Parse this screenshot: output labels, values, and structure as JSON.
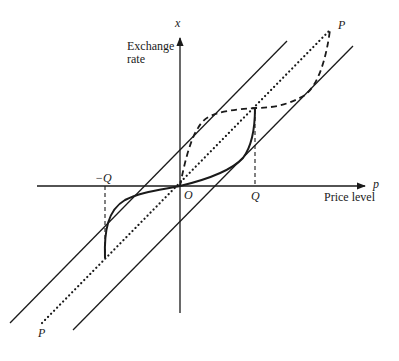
{
  "diagram": {
    "y_axis": {
      "symbol": "x",
      "label_line1": "Exchange",
      "label_line2": "rate"
    },
    "x_axis": {
      "symbol": "p",
      "label": "Price level"
    },
    "origin_label": "O",
    "tick_labels": {
      "positive": "Q",
      "negative": "−Q"
    },
    "line_labels": {
      "upper": "P",
      "lower": "P"
    },
    "curves": [
      {
        "name": "parity-line",
        "style": "dotted",
        "label": "PP"
      },
      {
        "name": "upper-band-line",
        "style": "solid"
      },
      {
        "name": "lower-band-line",
        "style": "solid"
      },
      {
        "name": "exchange-rate-path",
        "style": "solid-thick"
      },
      {
        "name": "overshoot-path",
        "style": "dashed"
      }
    ],
    "color": "#1a1a1a"
  }
}
